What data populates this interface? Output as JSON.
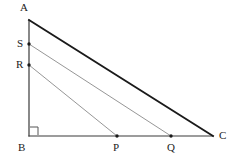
{
  "figure": {
    "width": 235,
    "height": 159,
    "background_color": "#ffffff"
  },
  "style": {
    "hypotenuse_color": "#1a1a1a",
    "hypotenuse_width": 1.9,
    "leg_color": "#3a3a3a",
    "leg_width": 1.2,
    "parallel_color": "#8a8a8a",
    "parallel_width": 0.9,
    "dot_color": "#1a1a1a",
    "dot_radius": 1.7,
    "right_angle_color": "#555555",
    "label_color": "#222222",
    "label_font_size": 11
  },
  "points": {
    "A": {
      "label": "A",
      "x": 29,
      "y": 20,
      "label_x": 20,
      "label_y": 2,
      "dot": false
    },
    "B": {
      "label": "B",
      "x": 29,
      "y": 136,
      "label_x": 18,
      "label_y": 142,
      "dot": false
    },
    "C": {
      "label": "C",
      "x": 213,
      "y": 136,
      "label_x": 219,
      "label_y": 130,
      "dot": false
    },
    "S": {
      "label": "S",
      "x": 29,
      "y": 44,
      "label_x": 17,
      "label_y": 38,
      "dot": true
    },
    "R": {
      "label": "R",
      "x": 29,
      "y": 65,
      "label_x": 16,
      "label_y": 59,
      "dot": true
    },
    "P": {
      "label": "P",
      "x": 117,
      "y": 136,
      "label_x": 113,
      "label_y": 142,
      "dot": true
    },
    "Q": {
      "label": "Q",
      "x": 171,
      "y": 136,
      "label_x": 167,
      "label_y": 142,
      "dot": true
    }
  },
  "segments": [
    {
      "name": "segment-AC-hypotenuse",
      "from": "A",
      "to": "C",
      "role": "hypotenuse"
    },
    {
      "name": "segment-AB-vertical-leg",
      "from": "A",
      "to": "B",
      "role": "leg"
    },
    {
      "name": "segment-BC-horizontal-leg",
      "from": "B",
      "to": "C",
      "role": "leg"
    },
    {
      "name": "segment-SQ-parallel",
      "from": "S",
      "to": "Q",
      "role": "parallel"
    },
    {
      "name": "segment-RP-parallel",
      "from": "R",
      "to": "P",
      "role": "parallel"
    }
  ],
  "right_angle": {
    "at": "B",
    "size": 9,
    "name": "right-angle-marker-at-B"
  },
  "chart_data": {
    "type": "diagram",
    "vertices": [
      {
        "id": "A",
        "x": 29,
        "y": 20
      },
      {
        "id": "B",
        "x": 29,
        "y": 136
      },
      {
        "id": "C",
        "x": 213,
        "y": 136
      }
    ],
    "interior_points": [
      {
        "id": "S",
        "on": "AB",
        "x": 29,
        "y": 44
      },
      {
        "id": "R",
        "on": "AB",
        "x": 29,
        "y": 65
      },
      {
        "id": "P",
        "on": "BC",
        "x": 117,
        "y": 136
      },
      {
        "id": "Q",
        "on": "BC",
        "x": 171,
        "y": 136
      }
    ],
    "lines": [
      {
        "id": "AC",
        "endpoints": [
          "A",
          "C"
        ],
        "emphasis": "bold"
      },
      {
        "id": "AB",
        "endpoints": [
          "A",
          "B"
        ],
        "emphasis": "normal"
      },
      {
        "id": "BC",
        "endpoints": [
          "B",
          "C"
        ],
        "emphasis": "normal"
      },
      {
        "id": "SQ",
        "endpoints": [
          "S",
          "Q"
        ],
        "emphasis": "light"
      },
      {
        "id": "RP",
        "endpoints": [
          "R",
          "P"
        ],
        "emphasis": "light"
      }
    ],
    "annotations": [
      {
        "type": "right-angle",
        "at": "B"
      }
    ],
    "labels": [
      "A",
      "S",
      "R",
      "B",
      "P",
      "Q",
      "C"
    ]
  }
}
